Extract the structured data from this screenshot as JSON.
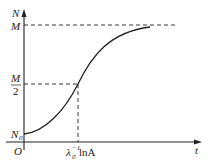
{
  "diagram": {
    "type": "logistic-growth-curve",
    "axes": {
      "y_label": "N",
      "x_label": "t",
      "origin_label": "O"
    },
    "y_marks": {
      "top": "M",
      "half_numerator": "M",
      "half_denominator": "2",
      "start": "N",
      "start_subscript": "0"
    },
    "x_marks": {
      "inflection_lambda": "λ",
      "inflection_lambda_sub": "0",
      "inflection_lambda_sup": "−1",
      "inflection_rest": " lnA"
    },
    "colors": {
      "line": "#222222",
      "background": "#ffffff"
    }
  }
}
